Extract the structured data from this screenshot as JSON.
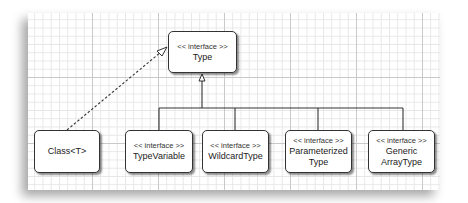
{
  "diagram": {
    "type": "uml-class-hierarchy",
    "nodes": [
      {
        "id": "type",
        "stereotype": "<< interface >>",
        "name_lines": [
          "Type"
        ]
      },
      {
        "id": "class",
        "stereotype": "",
        "name_lines": [
          "Class<T>"
        ]
      },
      {
        "id": "typevariable",
        "stereotype": "<< interface >>",
        "name_lines": [
          "TypeVariable"
        ]
      },
      {
        "id": "wildcardtype",
        "stereotype": "<< interface >>",
        "name_lines": [
          "WildcardType"
        ]
      },
      {
        "id": "parameterizedtype",
        "stereotype": "<< interface >>",
        "name_lines": [
          "Parameterized",
          "Type"
        ]
      },
      {
        "id": "genericarraytype",
        "stereotype": "<< interface >>",
        "name_lines": [
          "Generic",
          "ArrayType"
        ]
      }
    ],
    "edges": [
      {
        "from": "class",
        "to": "type",
        "style": "dashed",
        "arrow": "hollow-triangle",
        "meaning": "implements"
      },
      {
        "from": "typevariable",
        "to": "type",
        "style": "solid",
        "arrow": "hollow-triangle",
        "meaning": "extends"
      },
      {
        "from": "wildcardtype",
        "to": "type",
        "style": "solid",
        "arrow": "hollow-triangle",
        "meaning": "extends"
      },
      {
        "from": "parameterizedtype",
        "to": "type",
        "style": "solid",
        "arrow": "hollow-triangle",
        "meaning": "extends"
      },
      {
        "from": "genericarraytype",
        "to": "type",
        "style": "solid",
        "arrow": "hollow-triangle",
        "meaning": "extends"
      }
    ]
  }
}
